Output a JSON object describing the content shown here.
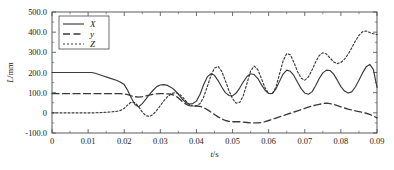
{
  "chart_data": {
    "type": "line",
    "title": "",
    "xlabel": "t/s",
    "ylabel": "L/mm",
    "xlim": [
      0,
      0.09
    ],
    "ylim": [
      -100,
      500
    ],
    "grid": false,
    "legend_position": "top-left-inside",
    "xticks": [
      "0",
      "0.01",
      "0.02",
      "0.03",
      "0.04",
      "0.05",
      "0.06",
      "0.07",
      "0.08",
      "0.09"
    ],
    "xtick_values": [
      0,
      0.01,
      0.02,
      0.03,
      0.04,
      0.05,
      0.06,
      0.07,
      0.08,
      0.09
    ],
    "yticks": [
      "500.0",
      "400.0",
      "300.0",
      "200.0",
      "100.0",
      "0",
      "-100.0"
    ],
    "ytick_values": [
      500,
      400,
      300,
      200,
      100,
      0,
      -100
    ],
    "x": [
      0,
      0.002,
      0.004,
      0.006,
      0.008,
      0.01,
      0.011,
      0.012,
      0.014,
      0.016,
      0.018,
      0.019,
      0.02,
      0.021,
      0.022,
      0.023,
      0.024,
      0.025,
      0.026,
      0.027,
      0.028,
      0.029,
      0.03,
      0.031,
      0.032,
      0.033,
      0.034,
      0.035,
      0.036,
      0.037,
      0.038,
      0.039,
      0.04,
      0.041,
      0.042,
      0.043,
      0.044,
      0.045,
      0.046,
      0.047,
      0.048,
      0.049,
      0.05,
      0.051,
      0.052,
      0.053,
      0.054,
      0.055,
      0.056,
      0.057,
      0.058,
      0.059,
      0.06,
      0.061,
      0.062,
      0.063,
      0.064,
      0.065,
      0.066,
      0.067,
      0.068,
      0.069,
      0.07,
      0.071,
      0.072,
      0.073,
      0.074,
      0.075,
      0.076,
      0.077,
      0.078,
      0.079,
      0.08,
      0.081,
      0.082,
      0.083,
      0.084,
      0.085,
      0.086,
      0.087,
      0.088,
      0.089,
      0.09
    ],
    "series": [
      {
        "name": "X",
        "style": "solid",
        "color": "#3a3a3a",
        "values": [
          200,
          200,
          200,
          200,
          200,
          200,
          200,
          196,
          184,
          172,
          160,
          152,
          140,
          110,
          72,
          40,
          30,
          46,
          68,
          92,
          112,
          130,
          138,
          140,
          136,
          126,
          112,
          92,
          70,
          52,
          44,
          46,
          58,
          92,
          140,
          178,
          194,
          186,
          160,
          128,
          100,
          86,
          84,
          98,
          124,
          154,
          180,
          194,
          190,
          170,
          140,
          112,
          96,
          96,
          118,
          156,
          192,
          212,
          206,
          184,
          152,
          120,
          98,
          92,
          104,
          134,
          170,
          198,
          212,
          210,
          192,
          162,
          130,
          108,
          98,
          104,
          128,
          162,
          198,
          228,
          240,
          214,
          126
        ]
      },
      {
        "name": "y",
        "style": "dashed",
        "color": "#3a3a3a",
        "values": [
          95,
          95,
          95,
          95,
          95,
          95,
          95,
          95,
          95,
          95,
          95,
          95,
          94,
          90,
          84,
          80,
          78,
          80,
          84,
          88,
          92,
          94,
          95,
          95,
          94,
          92,
          86,
          74,
          58,
          44,
          36,
          34,
          34,
          32,
          26,
          16,
          4,
          -8,
          -20,
          -30,
          -38,
          -42,
          -44,
          -44,
          -44,
          -46,
          -48,
          -50,
          -50,
          -50,
          -48,
          -44,
          -38,
          -32,
          -26,
          -20,
          -14,
          -8,
          -2,
          4,
          10,
          16,
          22,
          28,
          34,
          38,
          42,
          46,
          48,
          46,
          42,
          36,
          30,
          24,
          18,
          14,
          10,
          6,
          2,
          -2,
          -8,
          -16,
          -25
        ]
      },
      {
        "name": "Z",
        "style": "dotted",
        "color": "#3a3a3a",
        "values": [
          0,
          0,
          0,
          0,
          0,
          0,
          0,
          0,
          2,
          4,
          8,
          12,
          22,
          40,
          54,
          50,
          30,
          4,
          -14,
          -18,
          -8,
          12,
          36,
          60,
          80,
          94,
          100,
          96,
          82,
          60,
          42,
          34,
          34,
          46,
          78,
          130,
          184,
          222,
          230,
          206,
          160,
          110,
          70,
          48,
          52,
          86,
          146,
          208,
          232,
          214,
          170,
          124,
          96,
          94,
          126,
          192,
          258,
          294,
          288,
          250,
          204,
          172,
          162,
          178,
          212,
          252,
          284,
          298,
          292,
          272,
          252,
          244,
          250,
          266,
          290,
          322,
          356,
          384,
          402,
          406,
          398,
          392,
          388
        ]
      }
    ]
  },
  "legend": {
    "entries": [
      {
        "label": "X",
        "style": "solid"
      },
      {
        "label": "y",
        "style": "dashed"
      },
      {
        "label": "Z",
        "style": "dotted"
      }
    ]
  }
}
